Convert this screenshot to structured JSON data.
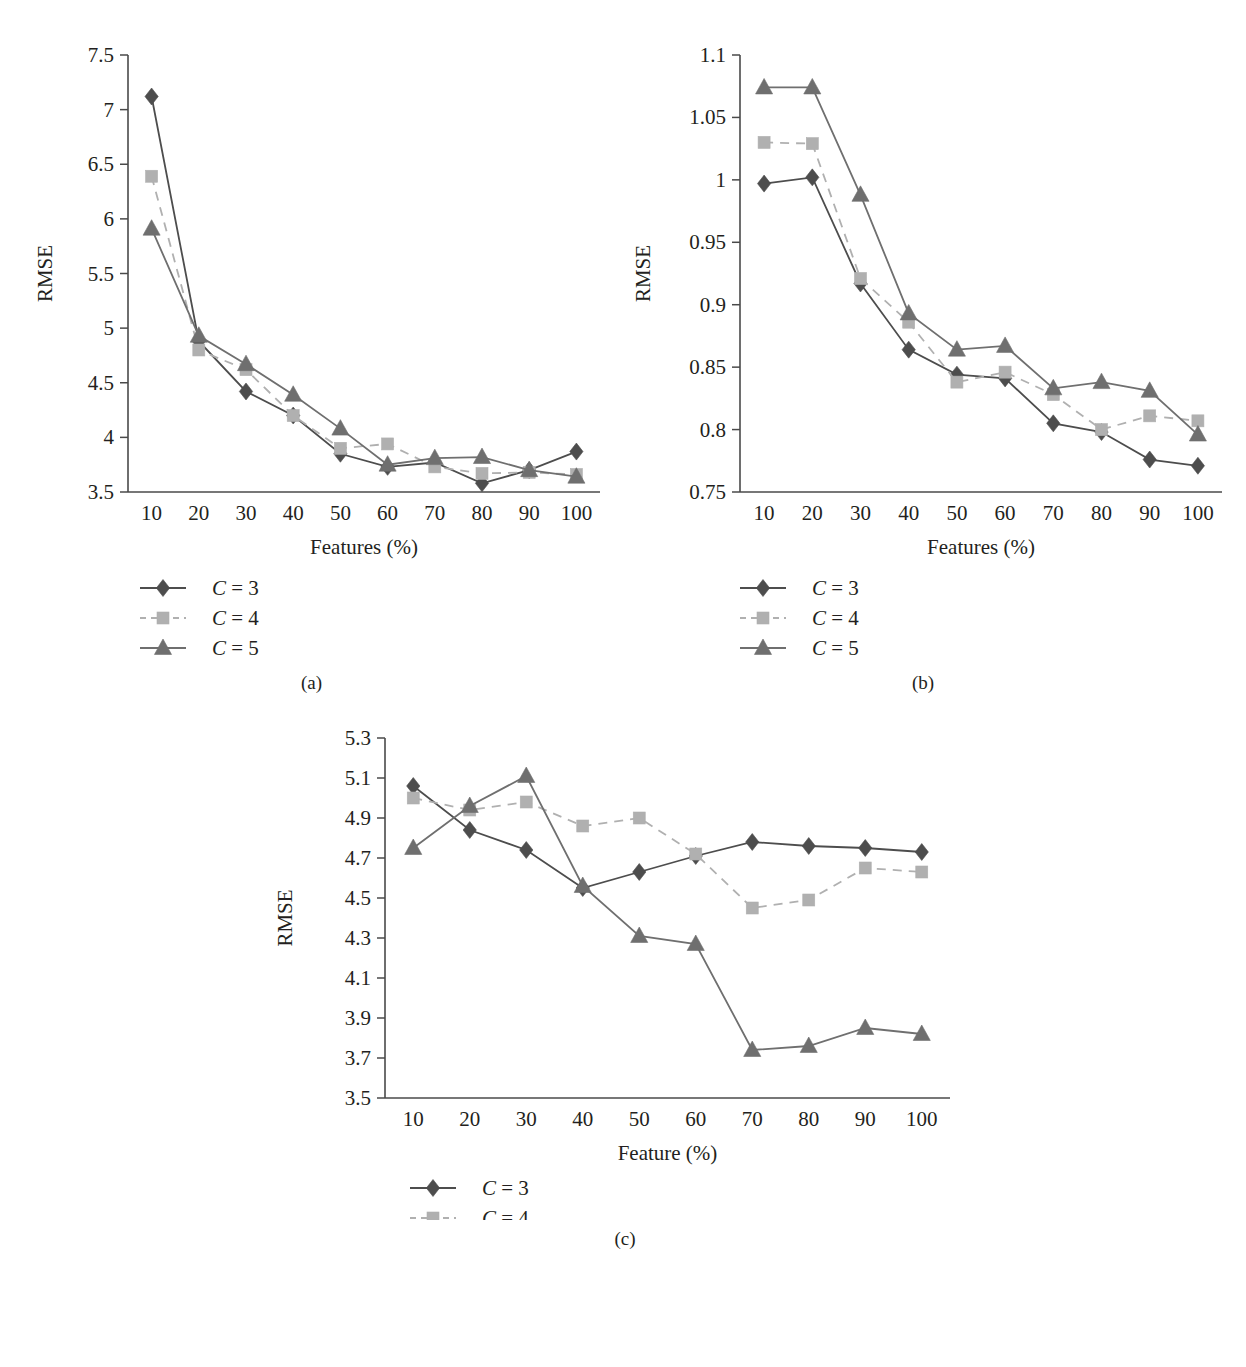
{
  "figure": {
    "subcaptions": [
      "(a)",
      "(b)",
      "(c)"
    ]
  },
  "panels": [
    {
      "id": "a",
      "caption": "(a)",
      "ylabel": "RMSE",
      "xlabel": "Features (%)",
      "legend": [
        {
          "marker": "diamond-marker",
          "label_prefix": "C",
          "label": "C = 3"
        },
        {
          "marker": "square-marker",
          "label_prefix": "C",
          "label": "C = 4"
        },
        {
          "marker": "triangle-marker",
          "label_prefix": "C",
          "label": "C = 5"
        }
      ]
    },
    {
      "id": "b",
      "caption": "(b)",
      "ylabel": "RMSE",
      "xlabel": "Features (%)",
      "legend": [
        {
          "marker": "diamond-marker",
          "label_prefix": "C",
          "label": "C = 3"
        },
        {
          "marker": "square-marker",
          "label_prefix": "C",
          "label": "C = 4"
        },
        {
          "marker": "triangle-marker",
          "label_prefix": "C",
          "label": "C = 5"
        }
      ]
    },
    {
      "id": "c",
      "caption": "(c)",
      "ylabel": "RMSE",
      "xlabel": "Feature (%)",
      "legend": [
        {
          "marker": "diamond-marker",
          "label_prefix": "C",
          "label": "C = 3"
        },
        {
          "marker": "square-marker",
          "label_prefix": "C",
          "label": "C = 4"
        },
        {
          "marker": "triangle-marker",
          "label_prefix": "C",
          "label": "C = 5"
        }
      ]
    }
  ],
  "colors": {
    "c3": "#4d4d4d",
    "c4": "#b0b0b0",
    "c5": "#6f6f6f",
    "axis": "#4a4a4a",
    "text": "#231f20",
    "background": "#ffffff"
  },
  "chart_data": [
    {
      "type": "line",
      "panel": "(a)",
      "title": "",
      "xlabel": "Features (%)",
      "ylabel": "RMSE",
      "categories": [
        10,
        20,
        30,
        40,
        50,
        60,
        70,
        80,
        90,
        100
      ],
      "xticklabels": [
        "10",
        "20",
        "30",
        "40",
        "50",
        "60",
        "70",
        "80",
        "90",
        "100"
      ],
      "yticklabels": [
        "3.5",
        "4",
        "4.5",
        "5",
        "5.5",
        "6",
        "6.5",
        "7",
        "7.5"
      ],
      "ylim": [
        3.5,
        7.5
      ],
      "ytickvalues": [
        3.5,
        4,
        4.5,
        5,
        5.5,
        6,
        6.5,
        7,
        7.5
      ],
      "grid": false,
      "legend_position": "below",
      "series": [
        {
          "name": "C = 3",
          "marker": "diamond",
          "linestyle": "solid",
          "color": "#4d4d4d",
          "values": [
            7.12,
            4.88,
            4.42,
            4.2,
            3.85,
            3.73,
            3.77,
            3.58,
            3.7,
            3.87
          ]
        },
        {
          "name": "C = 4",
          "marker": "square",
          "linestyle": "dashed",
          "color": "#b0b0b0",
          "values": [
            6.39,
            4.8,
            4.62,
            4.2,
            3.9,
            3.94,
            3.73,
            3.67,
            3.68,
            3.66
          ]
        },
        {
          "name": "C = 5",
          "marker": "triangle",
          "linestyle": "solid",
          "color": "#6f6f6f",
          "values": [
            5.91,
            4.93,
            4.67,
            4.39,
            4.08,
            3.75,
            3.81,
            3.82,
            3.7,
            3.64
          ]
        }
      ]
    },
    {
      "type": "line",
      "panel": "(b)",
      "title": "",
      "xlabel": "Features (%)",
      "ylabel": "RMSE",
      "categories": [
        10,
        20,
        30,
        40,
        50,
        60,
        70,
        80,
        90,
        100
      ],
      "xticklabels": [
        "10",
        "20",
        "30",
        "40",
        "50",
        "60",
        "70",
        "80",
        "90",
        "100"
      ],
      "yticklabels": [
        "0.75",
        "0.8",
        "0.85",
        "0.9",
        "0.95",
        "1",
        "1.05",
        "1.1"
      ],
      "ylim": [
        0.75,
        1.1
      ],
      "ytickvalues": [
        0.75,
        0.8,
        0.85,
        0.9,
        0.95,
        1.0,
        1.05,
        1.1
      ],
      "grid": false,
      "legend_position": "below",
      "series": [
        {
          "name": "C = 3",
          "marker": "diamond",
          "linestyle": "solid",
          "color": "#4d4d4d",
          "values": [
            0.997,
            1.002,
            0.917,
            0.864,
            0.844,
            0.841,
            0.805,
            0.798,
            0.776,
            0.771
          ]
        },
        {
          "name": "C = 4",
          "marker": "square",
          "linestyle": "dashed",
          "color": "#b0b0b0",
          "values": [
            1.03,
            1.029,
            0.921,
            0.886,
            0.838,
            0.846,
            0.828,
            0.8,
            0.811,
            0.807
          ]
        },
        {
          "name": "C = 5",
          "marker": "triangle",
          "linestyle": "solid",
          "color": "#6f6f6f",
          "values": [
            1.074,
            1.074,
            0.988,
            0.893,
            0.864,
            0.867,
            0.833,
            0.838,
            0.831,
            0.796
          ]
        }
      ]
    },
    {
      "type": "line",
      "panel": "(c)",
      "title": "",
      "xlabel": "Feature (%)",
      "ylabel": "RMSE",
      "categories": [
        10,
        20,
        30,
        40,
        50,
        60,
        70,
        80,
        90,
        100
      ],
      "xticklabels": [
        "10",
        "20",
        "30",
        "40",
        "50",
        "60",
        "70",
        "80",
        "90",
        "100"
      ],
      "yticklabels": [
        "3.5",
        "3.7",
        "3.9",
        "4.1",
        "4.3",
        "4.5",
        "4.7",
        "4.9",
        "5.1",
        "5.3"
      ],
      "ylim": [
        3.5,
        5.3
      ],
      "ytickvalues": [
        3.5,
        3.7,
        3.9,
        4.1,
        4.3,
        4.5,
        4.7,
        4.9,
        5.1,
        5.3
      ],
      "grid": false,
      "legend_position": "below",
      "series": [
        {
          "name": "C = 3",
          "marker": "diamond",
          "linestyle": "solid",
          "color": "#4d4d4d",
          "values": [
            5.06,
            4.84,
            4.74,
            4.55,
            4.63,
            4.71,
            4.78,
            4.76,
            4.75,
            4.73
          ]
        },
        {
          "name": "C = 4",
          "marker": "square",
          "linestyle": "dashed",
          "color": "#b0b0b0",
          "values": [
            5.0,
            4.94,
            4.98,
            4.86,
            4.9,
            4.72,
            4.45,
            4.49,
            4.65,
            4.63
          ]
        },
        {
          "name": "C = 5",
          "marker": "triangle",
          "linestyle": "solid",
          "color": "#6f6f6f",
          "values": [
            4.75,
            4.96,
            5.11,
            4.56,
            4.31,
            4.27,
            3.74,
            3.76,
            3.85,
            3.82
          ]
        }
      ]
    }
  ]
}
